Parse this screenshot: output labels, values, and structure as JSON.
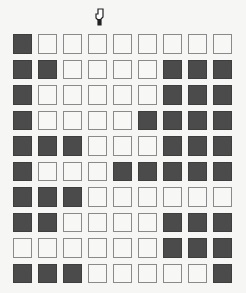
{
  "board": {
    "rows": 10,
    "cols": 9,
    "colors": {
      "on": "#4b4b4b",
      "off": "#f7f7f5",
      "border": "#8a8a8a",
      "background": "#f6f6f4"
    },
    "cells": [
      [
        1,
        0,
        0,
        0,
        0,
        0,
        0,
        0,
        0
      ],
      [
        1,
        1,
        0,
        0,
        0,
        0,
        1,
        1,
        1
      ],
      [
        1,
        0,
        0,
        0,
        0,
        0,
        1,
        1,
        1
      ],
      [
        1,
        0,
        0,
        0,
        0,
        1,
        1,
        1,
        1
      ],
      [
        1,
        1,
        1,
        0,
        0,
        0,
        1,
        1,
        1
      ],
      [
        1,
        0,
        0,
        0,
        1,
        1,
        1,
        1,
        1
      ],
      [
        1,
        1,
        1,
        0,
        0,
        0,
        0,
        0,
        0
      ],
      [
        1,
        1,
        0,
        0,
        0,
        0,
        1,
        1,
        1
      ],
      [
        0,
        0,
        0,
        0,
        0,
        0,
        1,
        1,
        1
      ],
      [
        1,
        1,
        1,
        0,
        0,
        0,
        0,
        0,
        1
      ]
    ]
  },
  "cursor": {
    "icon": "pointer-hand-icon",
    "x": 95,
    "y": 8
  }
}
